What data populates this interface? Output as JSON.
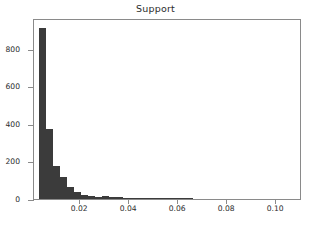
{
  "chart_data": {
    "type": "bar",
    "subtype": "histogram",
    "title": "Support",
    "xlabel": "",
    "ylabel": "",
    "grid": false,
    "legend": null,
    "bar_color": "#3b3b3b",
    "background_color": "#ffffff",
    "axis_color": "#8a8a8a",
    "xlim": [
      0.0012,
      0.1105
    ],
    "ylim": [
      0,
      965
    ],
    "xticks": [
      0.02,
      0.04,
      0.06,
      0.08,
      0.1
    ],
    "xtick_labels": [
      "0.02",
      "0.04",
      "0.06",
      "0.08",
      "0.10"
    ],
    "yticks": [
      0,
      200,
      400,
      600,
      800
    ],
    "ytick_labels": [
      "0",
      "200",
      "400",
      "600",
      "800"
    ],
    "bin_width": 0.00286,
    "bin_starts": [
      0.0032,
      0.0061,
      0.0089,
      0.0118,
      0.0146,
      0.0175,
      0.0203,
      0.0232,
      0.0261,
      0.0289,
      0.0318,
      0.0346,
      0.0375,
      0.0403,
      0.0432,
      0.046,
      0.0489,
      0.0518,
      0.0546,
      0.0575,
      0.0603,
      0.0632
    ],
    "values": [
      912,
      373,
      178,
      120,
      62,
      38,
      22,
      14,
      12,
      16,
      10,
      9,
      6,
      5,
      4,
      4,
      3,
      2,
      2,
      1,
      1,
      1
    ],
    "bar_labels": [
      "0.0032",
      "0.0061",
      "0.0089",
      "0.0118",
      "0.0146",
      "0.0175",
      "0.0203",
      "0.0232",
      "0.0261",
      "0.0289",
      "0.0318",
      "0.0346",
      "0.0375",
      "0.0403",
      "0.0432",
      "0.0460",
      "0.0489",
      "0.0518",
      "0.0546",
      "0.0575",
      "0.0603",
      "0.0632"
    ]
  }
}
